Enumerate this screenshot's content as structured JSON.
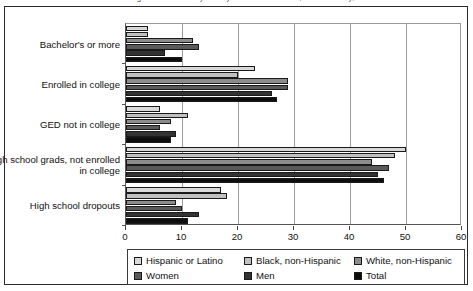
{
  "title": {
    "text": "Percentage distribution of youth by educational status, race/ethnicity, and sex"
  },
  "chart_data": {
    "type": "bar",
    "orientation": "horizontal",
    "title": "",
    "xlabel": "",
    "ylabel": "",
    "xlim": [
      0,
      60
    ],
    "xticks": [
      0,
      10,
      20,
      30,
      40,
      50,
      60
    ],
    "grid": true,
    "legend_position": "bottom",
    "categories": [
      "Bachelor's or more",
      "Enrolled in college",
      "GED not in college",
      "High school grads, not enrolled in college",
      "High school dropouts"
    ],
    "series": [
      {
        "name": "Hispanic or Latino",
        "color": "#d9d9d9",
        "values": [
          4,
          23,
          6,
          50,
          17
        ]
      },
      {
        "name": "Black, non-Hispanic",
        "color": "#c0c0c0",
        "values": [
          4,
          20,
          11,
          48,
          18
        ]
      },
      {
        "name": "White, non-Hispanic",
        "color": "#8c8c8c",
        "values": [
          12,
          29,
          8,
          44,
          9
        ]
      },
      {
        "name": "Women",
        "color": "#5a5a5a",
        "values": [
          13,
          29,
          6,
          47,
          10
        ]
      },
      {
        "name": "Men",
        "color": "#333333",
        "values": [
          7,
          26,
          9,
          45,
          13
        ]
      },
      {
        "name": "Total",
        "color": "#0d0d0d",
        "values": [
          10,
          27,
          8,
          46,
          11
        ]
      }
    ]
  },
  "legend": {
    "rows": [
      [
        {
          "label": "Hispanic or Latino",
          "color": "#d9d9d9"
        },
        {
          "label": "Black, non-Hispanic",
          "color": "#c0c0c0"
        },
        {
          "label": "White, non-Hispanic",
          "color": "#8c8c8c"
        }
      ],
      [
        {
          "label": "Women",
          "color": "#5a5a5a"
        },
        {
          "label": "Men",
          "color": "#333333"
        },
        {
          "label": "Total",
          "color": "#0d0d0d"
        }
      ]
    ]
  }
}
